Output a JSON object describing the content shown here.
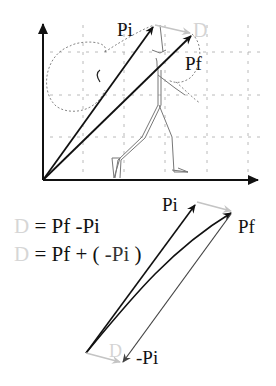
{
  "top_diagram": {
    "labels": {
      "pi": "Pi",
      "pf": "Pf",
      "d": "D"
    },
    "figure": "walking-stick-figure"
  },
  "bottom_diagram": {
    "labels": {
      "pi": "Pi",
      "pf": "Pf",
      "d": "D",
      "neg_pi": "-Pi"
    }
  },
  "equations": [
    {
      "lhs": "D",
      "rhs": "= Pf -Pi"
    },
    {
      "lhs": "D",
      "rhs_prefix": "= Pf + (",
      "rhs_neg": "-Pi",
      "rhs_suffix": ")"
    }
  ],
  "colors": {
    "vector_dark": "#111111",
    "vector_displacement": "#c8c8c8",
    "grid": "#9a9a9a",
    "figure": "#707070"
  }
}
